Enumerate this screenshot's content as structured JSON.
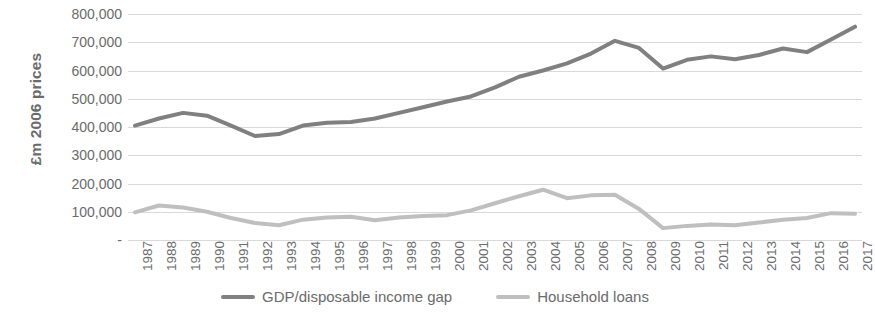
{
  "chart_data": {
    "type": "line",
    "title": "",
    "xlabel": "",
    "ylabel": "£m 2006 prices",
    "ylim": [
      0,
      800000
    ],
    "ytick_step": 100000,
    "grid": true,
    "legend_position": "bottom-center",
    "x": [
      1987,
      1988,
      1989,
      1990,
      1991,
      1992,
      1993,
      1994,
      1995,
      1996,
      1997,
      1998,
      1999,
      2000,
      2001,
      2002,
      2003,
      2004,
      2005,
      2006,
      2007,
      2008,
      2009,
      2010,
      2011,
      2012,
      2013,
      2014,
      2015,
      2016,
      2017
    ],
    "categories": [
      "1987",
      "1988",
      "1989",
      "1990",
      "1991",
      "1992",
      "1993",
      "1994",
      "1995",
      "1996",
      "1997",
      "1998",
      "1999",
      "2000",
      "2001",
      "2002",
      "2003",
      "2004",
      "2005",
      "2006",
      "2007",
      "2008",
      "2009",
      "2010",
      "2011",
      "2012",
      "2013",
      "2014",
      "2015",
      "2016",
      "2017"
    ],
    "ytick_labels": [
      "-",
      "100,000",
      "200,000",
      "300,000",
      "400,000",
      "500,000",
      "600,000",
      "700,000",
      "800,000"
    ],
    "ytick_values": [
      0,
      100000,
      200000,
      300000,
      400000,
      500000,
      600000,
      700000,
      800000
    ],
    "series": [
      {
        "name": "GDP/disposable income gap",
        "color": "#808080",
        "values": [
          405000,
          430000,
          450000,
          440000,
          405000,
          368000,
          375000,
          405000,
          415000,
          418000,
          430000,
          450000,
          470000,
          490000,
          508000,
          540000,
          578000,
          600000,
          625000,
          660000,
          705000,
          680000,
          607000,
          638000,
          650000,
          640000,
          655000,
          678000,
          665000,
          710000,
          755000
        ]
      },
      {
        "name": "Household loans",
        "color": "#bfbfbf",
        "values": [
          98000,
          122000,
          115000,
          100000,
          78000,
          60000,
          52000,
          72000,
          80000,
          82000,
          70000,
          80000,
          85000,
          88000,
          105000,
          130000,
          155000,
          178000,
          148000,
          158000,
          160000,
          110000,
          42000,
          50000,
          55000,
          52000,
          62000,
          72000,
          78000,
          95000,
          93000
        ]
      }
    ]
  },
  "legend": {
    "entries": [
      {
        "label": "GDP/disposable income gap",
        "color": "#808080"
      },
      {
        "label": "Household loans",
        "color": "#bfbfbf"
      }
    ]
  }
}
